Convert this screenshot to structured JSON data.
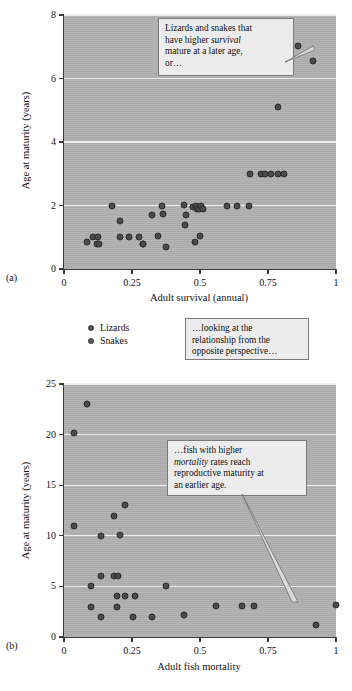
{
  "figure": {
    "panel_a_letter": "(a)",
    "panel_b_letter": "(b)"
  },
  "legend": {
    "items": [
      {
        "label": "Lizards",
        "color": "#5a5a5a"
      },
      {
        "label": "Snakes",
        "color": "#5a5a5a"
      }
    ]
  },
  "callouts": {
    "top": {
      "line1": "Lizards and snakes that",
      "line2_pre": "have higher ",
      "line2_em": "survival",
      "line3": "mature at a later age,",
      "line4": "or…"
    },
    "middle": {
      "line1": "…looking at the",
      "line2": "relationship from the",
      "line3": "opposite perspective…"
    },
    "bottom": {
      "line1": "…fish with higher",
      "line2_em": "mortality",
      "line2_post": " rates reach",
      "line3": "reproductive maturity at",
      "line4": "an earlier age."
    }
  },
  "chart_data": [
    {
      "type": "scatter",
      "panel": "(a)",
      "title": "",
      "xlabel": "Adult survival (annual)",
      "ylabel": "Age at maturity (years)",
      "xlim": [
        0,
        1
      ],
      "ylim": [
        0,
        8
      ],
      "xticks": [
        0,
        0.25,
        0.5,
        0.75,
        1
      ],
      "xticklabels": [
        "0",
        "0.25",
        "0.5",
        "0.75",
        "1"
      ],
      "yticks": [
        0,
        2,
        4,
        6,
        8
      ],
      "yticklabels": [
        "0",
        "2",
        "4",
        "6",
        "8"
      ],
      "grid": "horizontal",
      "legend_position": "below-plot",
      "series": [
        {
          "name": "Lizards and snakes",
          "marker_color": "#4b4b4b",
          "points": [
            [
              0.085,
              0.85
            ],
            [
              0.105,
              1.0
            ],
            [
              0.12,
              0.8
            ],
            [
              0.125,
              1.0
            ],
            [
              0.13,
              0.78
            ],
            [
              0.175,
              2.0
            ],
            [
              0.205,
              1.5
            ],
            [
              0.205,
              1.0
            ],
            [
              0.24,
              1.0
            ],
            [
              0.275,
              1.0
            ],
            [
              0.29,
              0.8
            ],
            [
              0.29,
              0.78
            ],
            [
              0.325,
              1.7
            ],
            [
              0.345,
              1.05
            ],
            [
              0.36,
              2.0
            ],
            [
              0.365,
              1.72
            ],
            [
              0.375,
              0.68
            ],
            [
              0.44,
              2.03
            ],
            [
              0.445,
              1.38
            ],
            [
              0.45,
              1.7
            ],
            [
              0.475,
              1.95
            ],
            [
              0.48,
              0.85
            ],
            [
              0.485,
              2.0
            ],
            [
              0.49,
              1.88
            ],
            [
              0.495,
              1.9
            ],
            [
              0.5,
              1.05
            ],
            [
              0.505,
              2.0
            ],
            [
              0.51,
              1.88
            ],
            [
              0.6,
              2.0
            ],
            [
              0.635,
              2.0
            ],
            [
              0.68,
              2.0
            ],
            [
              0.685,
              3.0
            ],
            [
              0.725,
              3.0
            ],
            [
              0.74,
              3.0
            ],
            [
              0.76,
              3.0
            ],
            [
              0.785,
              3.0
            ],
            [
              0.81,
              3.0
            ],
            [
              0.785,
              5.1
            ],
            [
              0.86,
              7.03
            ],
            [
              0.915,
              6.55
            ]
          ]
        }
      ]
    },
    {
      "type": "scatter",
      "panel": "(b)",
      "title": "",
      "xlabel": "Adult fish mortality",
      "ylabel": "Age at maturity (years)",
      "xlim": [
        0,
        1
      ],
      "ylim": [
        0,
        25
      ],
      "xticks": [
        0,
        0.25,
        0.5,
        0.75,
        1
      ],
      "xticklabels": [
        "0",
        "0.25",
        "0.5",
        "0.75",
        "1"
      ],
      "yticks": [
        0,
        5,
        10,
        15,
        20,
        25
      ],
      "yticklabels": [
        "0",
        "5",
        "10",
        "15",
        "20",
        "25"
      ],
      "grid": "horizontal",
      "legend_position": "none",
      "series": [
        {
          "name": "Fish",
          "marker_color": "#4b4b4b",
          "points": [
            [
              0.035,
              20.15
            ],
            [
              0.085,
              23.0
            ],
            [
              0.035,
              11.0
            ],
            [
              0.135,
              10.0
            ],
            [
              0.185,
              12.0
            ],
            [
              0.205,
              10.1
            ],
            [
              0.225,
              13.0
            ],
            [
              0.1,
              5.0
            ],
            [
              0.135,
              6.0
            ],
            [
              0.185,
              6.0
            ],
            [
              0.2,
              6.0
            ],
            [
              0.195,
              4.1
            ],
            [
              0.225,
              4.1
            ],
            [
              0.26,
              4.1
            ],
            [
              0.375,
              5.0
            ],
            [
              0.1,
              3.0
            ],
            [
              0.195,
              3.0
            ],
            [
              0.135,
              2.0
            ],
            [
              0.255,
              2.0
            ],
            [
              0.325,
              2.0
            ],
            [
              0.44,
              2.2
            ],
            [
              0.56,
              3.1
            ],
            [
              0.655,
              3.1
            ],
            [
              0.7,
              3.1
            ],
            [
              1.0,
              3.15
            ],
            [
              0.925,
              1.2
            ]
          ]
        }
      ]
    }
  ]
}
